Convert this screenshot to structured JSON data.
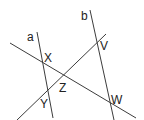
{
  "diagram": {
    "type": "geometry-lines",
    "line_color": "#3c3c3c",
    "label_color": "#222222",
    "lines": [
      {
        "name": "a",
        "x1": 37,
        "y1": 32,
        "x2": 53,
        "y2": 118
      },
      {
        "name": "b",
        "x1": 90,
        "y1": 10,
        "x2": 114,
        "y2": 120
      },
      {
        "name": "XW",
        "x1": 10,
        "y1": 43,
        "x2": 136,
        "y2": 118
      },
      {
        "name": "YV",
        "x1": 17,
        "y1": 120,
        "x2": 106,
        "y2": 34
      }
    ],
    "labels": {
      "a": "a",
      "b": "b",
      "X": "X",
      "Y": "Y",
      "Z": "Z",
      "V": "V",
      "W": "W"
    }
  }
}
